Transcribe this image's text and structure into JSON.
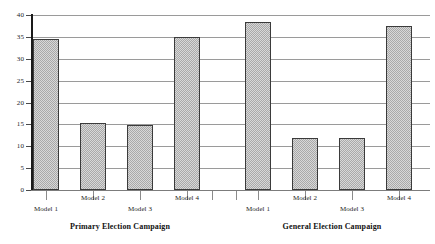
{
  "chart_data": {
    "type": "bar",
    "title": "",
    "xlabel": "",
    "ylabel": "",
    "ylim": [
      0,
      40
    ],
    "ytick_values": [
      0,
      5,
      10,
      15,
      20,
      25,
      30,
      35,
      40
    ],
    "ytick_labels": [
      "0",
      "5",
      "10",
      "15",
      "20",
      "25",
      "30",
      "35",
      "40"
    ],
    "grid": true,
    "legend": "none",
    "categories": [
      "Model 1",
      "Model 2",
      "Model 3",
      "Model 4"
    ],
    "panels": [
      {
        "name": "Primary Election Campaign",
        "categories": [
          "Model 1",
          "Model 2",
          "Model 3",
          "Model 4"
        ],
        "values": [
          34.6,
          15.4,
          14.9,
          34.9
        ]
      },
      {
        "name": "General Election Campaign",
        "categories": [
          "Model 1",
          "Model 2",
          "Model 3",
          "Model 4"
        ],
        "values": [
          38.4,
          11.8,
          11.9,
          37.6
        ]
      }
    ]
  },
  "axis": {
    "y_ticks": [
      "40",
      "35",
      "30",
      "25",
      "20",
      "15",
      "10",
      "5",
      "0"
    ]
  },
  "panel_captions": {
    "left": "Primary Election Campaign",
    "right": "General Election Campaign"
  },
  "x_labels": {
    "left": [
      "Model 1",
      "Model 2",
      "Model 3",
      "Model 4"
    ],
    "right": [
      "Model 1",
      "Model 2",
      "Model 3",
      "Model 4"
    ]
  },
  "style": {
    "bar_fill": "#a9a9a9",
    "bar_border": "#3b3b3b",
    "gridline_color": "#9a9a9a",
    "axis_color": "#1a1a1a",
    "text_color": "#1d1d1d"
  }
}
